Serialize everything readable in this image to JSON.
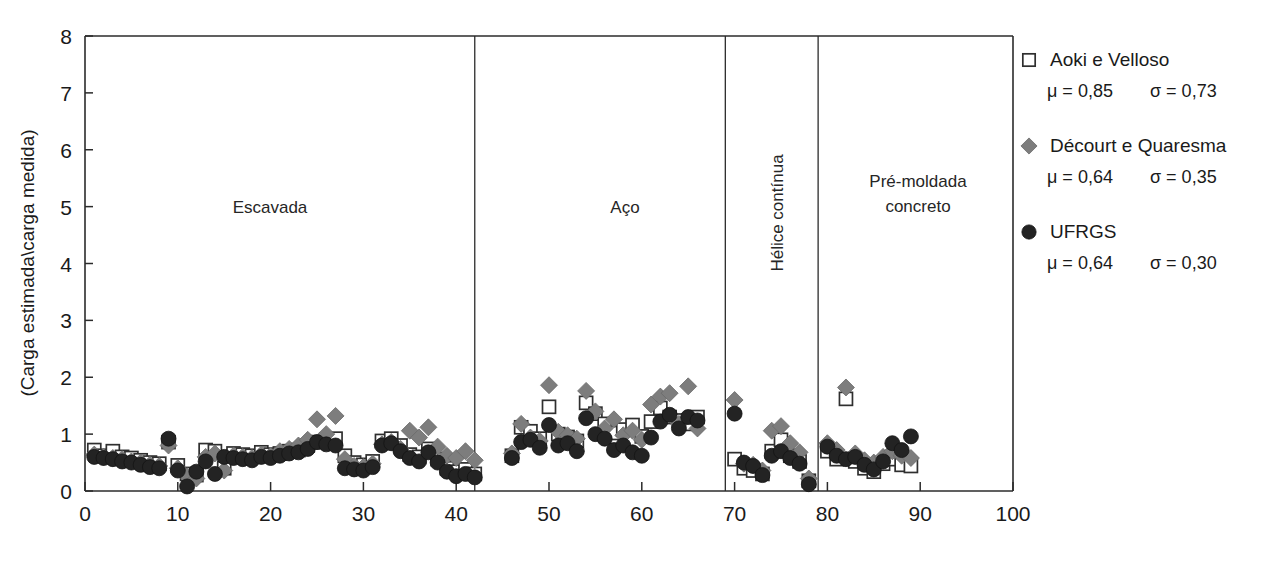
{
  "chart_data": {
    "type": "scatter",
    "title": "",
    "xlabel": "Número de estacas (ou ensaios)",
    "ylabel": "(Carga estimada\\carga medida)",
    "xlim": [
      0,
      100
    ],
    "ylim": [
      0,
      8
    ],
    "xticks": [
      0,
      10,
      20,
      30,
      40,
      50,
      60,
      70,
      80,
      90,
      100
    ],
    "yticks": [
      0,
      1,
      2,
      3,
      4,
      5,
      6,
      7,
      8
    ],
    "grid": false,
    "legend_position": "right",
    "panels": [
      {
        "label": "Escavada",
        "orientation": "horizontal",
        "x_start": 0,
        "x_end": 42
      },
      {
        "label": "Aço",
        "orientation": "horizontal",
        "x_start": 42,
        "x_end": 69
      },
      {
        "label": "Hélice contínua",
        "orientation": "vertical",
        "x_start": 69,
        "x_end": 79
      },
      {
        "label": "Pré-moldada\nconcreto",
        "orientation": "horizontal",
        "x_start": 79,
        "x_end": 100
      }
    ],
    "panel_dividers": [
      42,
      69,
      79
    ],
    "series": [
      {
        "name": "Aoki e Velloso",
        "marker": "open-square",
        "color": "#ffffff",
        "edge_color": "#2f2f2f",
        "mu": "0,85",
        "sigma": "0,73",
        "points": [
          [
            1,
            0.72
          ],
          [
            2,
            0.62
          ],
          [
            3,
            0.7
          ],
          [
            4,
            0.6
          ],
          [
            5,
            0.58
          ],
          [
            6,
            0.54
          ],
          [
            7,
            0.5
          ],
          [
            8,
            0.48
          ],
          [
            9,
            0.86
          ],
          [
            10,
            0.45
          ],
          [
            11,
            0.3
          ],
          [
            12,
            0.28
          ],
          [
            13,
            0.72
          ],
          [
            14,
            0.7
          ],
          [
            15,
            0.4
          ],
          [
            16,
            0.66
          ],
          [
            17,
            0.64
          ],
          [
            18,
            0.62
          ],
          [
            19,
            0.68
          ],
          [
            20,
            0.64
          ],
          [
            21,
            0.66
          ],
          [
            22,
            0.7
          ],
          [
            23,
            0.72
          ],
          [
            24,
            0.8
          ],
          [
            25,
            0.86
          ],
          [
            26,
            0.9
          ],
          [
            27,
            0.92
          ],
          [
            28,
            0.62
          ],
          [
            29,
            0.5
          ],
          [
            30,
            0.46
          ],
          [
            31,
            0.52
          ],
          [
            32,
            0.88
          ],
          [
            33,
            0.92
          ],
          [
            34,
            0.8
          ],
          [
            35,
            0.64
          ],
          [
            36,
            0.6
          ],
          [
            37,
            0.74
          ],
          [
            38,
            0.56
          ],
          [
            39,
            0.4
          ],
          [
            40,
            0.34
          ],
          [
            41,
            0.38
          ],
          [
            42,
            0.3
          ],
          [
            46,
            0.62
          ],
          [
            47,
            1.12
          ],
          [
            48,
            1.05
          ],
          [
            49,
            0.92
          ],
          [
            50,
            1.48
          ],
          [
            51,
            1.0
          ],
          [
            52,
            0.95
          ],
          [
            53,
            0.88
          ],
          [
            54,
            1.55
          ],
          [
            55,
            1.36
          ],
          [
            56,
            1.18
          ],
          [
            57,
            1.02
          ],
          [
            58,
            1.08
          ],
          [
            59,
            1.16
          ],
          [
            60,
            0.96
          ],
          [
            61,
            1.22
          ],
          [
            62,
            1.46
          ],
          [
            63,
            1.3
          ],
          [
            64,
            1.24
          ],
          [
            65,
            1.18
          ],
          [
            66,
            1.3
          ],
          [
            70,
            0.56
          ],
          [
            71,
            0.4
          ],
          [
            72,
            0.36
          ],
          [
            73,
            0.3
          ],
          [
            74,
            0.7
          ],
          [
            75,
            0.9
          ],
          [
            76,
            0.62
          ],
          [
            77,
            0.52
          ],
          [
            78,
            0.18
          ],
          [
            80,
            0.7
          ],
          [
            81,
            0.56
          ],
          [
            82,
            1.62
          ],
          [
            83,
            0.52
          ],
          [
            84,
            0.4
          ],
          [
            85,
            0.34
          ],
          [
            86,
            0.48
          ],
          [
            87,
            0.56
          ],
          [
            88,
            0.46
          ],
          [
            89,
            0.44
          ]
        ]
      },
      {
        "name": "Décourt e Quaresma",
        "marker": "diamond",
        "color": "#7d7d7d",
        "mu": "0,64",
        "sigma": "0,35",
        "points": [
          [
            1,
            0.64
          ],
          [
            2,
            0.6
          ],
          [
            3,
            0.58
          ],
          [
            4,
            0.56
          ],
          [
            5,
            0.52
          ],
          [
            6,
            0.5
          ],
          [
            7,
            0.46
          ],
          [
            8,
            0.44
          ],
          [
            9,
            0.8
          ],
          [
            10,
            0.4
          ],
          [
            11,
            0.26
          ],
          [
            12,
            0.22
          ],
          [
            13,
            0.6
          ],
          [
            14,
            0.66
          ],
          [
            15,
            0.36
          ],
          [
            16,
            0.62
          ],
          [
            17,
            0.6
          ],
          [
            18,
            0.58
          ],
          [
            19,
            0.64
          ],
          [
            20,
            0.62
          ],
          [
            21,
            0.7
          ],
          [
            22,
            0.74
          ],
          [
            23,
            0.8
          ],
          [
            24,
            0.9
          ],
          [
            25,
            1.26
          ],
          [
            26,
            1.0
          ],
          [
            27,
            1.32
          ],
          [
            28,
            0.56
          ],
          [
            29,
            0.44
          ],
          [
            30,
            0.42
          ],
          [
            31,
            0.48
          ],
          [
            32,
            0.82
          ],
          [
            33,
            0.86
          ],
          [
            34,
            0.74
          ],
          [
            35,
            1.06
          ],
          [
            36,
            0.94
          ],
          [
            37,
            1.12
          ],
          [
            38,
            0.78
          ],
          [
            39,
            0.62
          ],
          [
            40,
            0.58
          ],
          [
            41,
            0.7
          ],
          [
            42,
            0.54
          ],
          [
            46,
            0.66
          ],
          [
            47,
            1.18
          ],
          [
            48,
            0.94
          ],
          [
            49,
            0.88
          ],
          [
            50,
            1.86
          ],
          [
            51,
            1.04
          ],
          [
            52,
            0.98
          ],
          [
            53,
            0.92
          ],
          [
            54,
            1.76
          ],
          [
            55,
            1.4
          ],
          [
            56,
            1.1
          ],
          [
            57,
            1.26
          ],
          [
            58,
            0.98
          ],
          [
            59,
            1.06
          ],
          [
            60,
            0.9
          ],
          [
            61,
            1.52
          ],
          [
            62,
            1.66
          ],
          [
            63,
            1.72
          ],
          [
            64,
            1.18
          ],
          [
            65,
            1.84
          ],
          [
            66,
            1.1
          ],
          [
            70,
            1.6
          ],
          [
            71,
            0.48
          ],
          [
            72,
            0.46
          ],
          [
            73,
            0.36
          ],
          [
            74,
            1.06
          ],
          [
            75,
            1.14
          ],
          [
            76,
            0.84
          ],
          [
            77,
            0.68
          ],
          [
            78,
            0.22
          ],
          [
            80,
            0.84
          ],
          [
            81,
            0.72
          ],
          [
            82,
            1.82
          ],
          [
            83,
            0.66
          ],
          [
            84,
            0.54
          ],
          [
            85,
            0.5
          ],
          [
            86,
            0.6
          ],
          [
            87,
            0.7
          ],
          [
            88,
            0.62
          ],
          [
            89,
            0.58
          ]
        ]
      },
      {
        "name": "UFRGS",
        "marker": "circle",
        "color": "#232323",
        "mu": "0,64",
        "sigma": "0,30",
        "points": [
          [
            1,
            0.6
          ],
          [
            2,
            0.58
          ],
          [
            3,
            0.56
          ],
          [
            4,
            0.52
          ],
          [
            5,
            0.5
          ],
          [
            6,
            0.46
          ],
          [
            7,
            0.42
          ],
          [
            8,
            0.4
          ],
          [
            9,
            0.92
          ],
          [
            10,
            0.36
          ],
          [
            11,
            0.08
          ],
          [
            12,
            0.34
          ],
          [
            13,
            0.52
          ],
          [
            14,
            0.3
          ],
          [
            15,
            0.6
          ],
          [
            16,
            0.58
          ],
          [
            17,
            0.56
          ],
          [
            18,
            0.54
          ],
          [
            19,
            0.6
          ],
          [
            20,
            0.58
          ],
          [
            21,
            0.62
          ],
          [
            22,
            0.66
          ],
          [
            23,
            0.68
          ],
          [
            24,
            0.74
          ],
          [
            25,
            0.86
          ],
          [
            26,
            0.82
          ],
          [
            27,
            0.8
          ],
          [
            28,
            0.4
          ],
          [
            29,
            0.38
          ],
          [
            30,
            0.36
          ],
          [
            31,
            0.42
          ],
          [
            32,
            0.8
          ],
          [
            33,
            0.84
          ],
          [
            34,
            0.7
          ],
          [
            35,
            0.58
          ],
          [
            36,
            0.52
          ],
          [
            37,
            0.68
          ],
          [
            38,
            0.5
          ],
          [
            39,
            0.34
          ],
          [
            40,
            0.26
          ],
          [
            41,
            0.3
          ],
          [
            42,
            0.24
          ],
          [
            46,
            0.58
          ],
          [
            47,
            0.86
          ],
          [
            48,
            0.9
          ],
          [
            49,
            0.76
          ],
          [
            50,
            1.16
          ],
          [
            51,
            0.8
          ],
          [
            52,
            0.84
          ],
          [
            53,
            0.7
          ],
          [
            54,
            1.28
          ],
          [
            55,
            1.0
          ],
          [
            56,
            0.92
          ],
          [
            57,
            0.72
          ],
          [
            58,
            0.8
          ],
          [
            59,
            0.68
          ],
          [
            60,
            0.62
          ],
          [
            61,
            0.94
          ],
          [
            62,
            1.22
          ],
          [
            63,
            1.34
          ],
          [
            64,
            1.1
          ],
          [
            65,
            1.3
          ],
          [
            66,
            1.24
          ],
          [
            70,
            1.36
          ],
          [
            71,
            0.5
          ],
          [
            72,
            0.44
          ],
          [
            73,
            0.28
          ],
          [
            74,
            0.62
          ],
          [
            75,
            0.7
          ],
          [
            76,
            0.58
          ],
          [
            77,
            0.48
          ],
          [
            78,
            0.12
          ],
          [
            80,
            0.78
          ],
          [
            81,
            0.62
          ],
          [
            82,
            0.56
          ],
          [
            83,
            0.6
          ],
          [
            84,
            0.46
          ],
          [
            85,
            0.38
          ],
          [
            86,
            0.52
          ],
          [
            87,
            0.84
          ],
          [
            88,
            0.72
          ],
          [
            89,
            0.96
          ]
        ]
      }
    ]
  },
  "legend": {
    "entries": [
      {
        "label": "Aoki e Velloso",
        "mu_text": "μ = 0,85",
        "sigma_text": "σ = 0,73",
        "marker": "open-square"
      },
      {
        "label": "Décourt e Quaresma",
        "mu_text": "μ = 0,64",
        "sigma_text": "σ = 0,35",
        "marker": "diamond"
      },
      {
        "label": "UFRGS",
        "mu_text": "μ = 0,64",
        "sigma_text": "σ = 0,30",
        "marker": "circle"
      }
    ]
  },
  "axes": {
    "y_title": "(Carga estimada\\carga medida)",
    "y_ticks": [
      "0",
      "1",
      "2",
      "3",
      "4",
      "5",
      "6",
      "7",
      "8"
    ],
    "x_ticks": [
      "0",
      "10",
      "20",
      "30",
      "40",
      "50",
      "60",
      "70",
      "80",
      "90",
      "100"
    ]
  },
  "panel_labels": {
    "escavada": "Escavada",
    "aco": "Aço",
    "helice": "Hélice contínua",
    "premoldada_line1": "Pré-moldada",
    "premoldada_line2": "concreto"
  }
}
